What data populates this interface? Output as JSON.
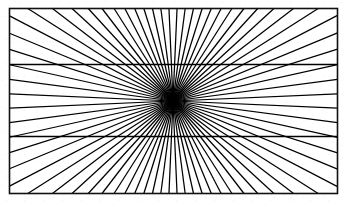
{
  "figure": {
    "type": "line-drawing",
    "caption": "",
    "background_color": "#ffffff",
    "ink_color": "#000000",
    "canvas": {
      "width": 347,
      "height": 205
    }
  },
  "frame": {
    "name": "outer-rectangle",
    "x": 9.5,
    "y": 8.5,
    "width": 328,
    "height": 185,
    "stroke_width": 1.6,
    "stroke_color": "#111111"
  },
  "vanishing_point": {
    "label": "convergence-point",
    "x": 173,
    "y": 101
  },
  "horizontal_lines": [
    {
      "label": "upper-horizontal",
      "y": 64.5,
      "x1": 9.5,
      "x2": 337.5,
      "stroke_width": 1.5
    },
    {
      "label": "lower-horizontal",
      "y": 136.5,
      "x1": 9.5,
      "x2": 337.5,
      "stroke_width": 1.5
    }
  ],
  "rays": {
    "count": 72,
    "stroke_width": 1.25,
    "stroke_color": "#000000",
    "description": "Straight lines emanating from the convergence point outward to the rectangle border, evenly spaced in angle.",
    "angles_deg": [
      2.5,
      7.5,
      12.5,
      17.5,
      22.5,
      27.5,
      32.5,
      37.5,
      42.5,
      47.5,
      52.5,
      57.5,
      62.5,
      67.5,
      72.5,
      77.5,
      82.5,
      87.5,
      92.5,
      97.5,
      102.5,
      107.5,
      112.5,
      117.5,
      122.5,
      127.5,
      132.5,
      137.5,
      142.5,
      147.5,
      152.5,
      157.5,
      162.5,
      167.5,
      172.5,
      177.5,
      182.5,
      187.5,
      192.5,
      197.5,
      202.5,
      207.5,
      212.5,
      217.5,
      222.5,
      227.5,
      232.5,
      237.5,
      242.5,
      247.5,
      252.5,
      257.5,
      262.5,
      267.5,
      272.5,
      277.5,
      282.5,
      287.5,
      292.5,
      297.5,
      302.5,
      307.5,
      312.5,
      317.5,
      322.5,
      327.5,
      332.5,
      337.5,
      342.5,
      347.5,
      352.5,
      357.5
    ]
  }
}
